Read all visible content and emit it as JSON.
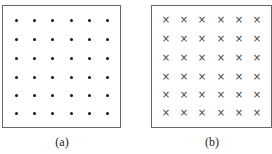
{
  "figures": [
    {
      "id": "a",
      "caption": "(a)",
      "symbol": "dot",
      "symbol_icon": "dot-icon",
      "rows": 6,
      "cols": 6,
      "meaning": "field out of page"
    },
    {
      "id": "b",
      "caption": "(b)",
      "symbol": "×",
      "symbol_icon": "cross-icon",
      "rows": 6,
      "cols": 6,
      "meaning": "field into page"
    }
  ]
}
